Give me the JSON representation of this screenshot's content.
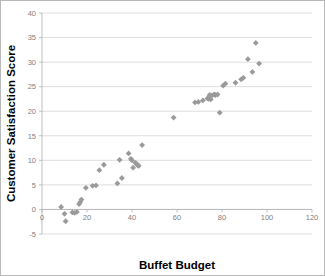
{
  "chart_data": {
    "type": "scatter",
    "title": "",
    "xlabel": "Buffet Budget",
    "ylabel": "Customer Satisfaction Score",
    "xlim": [
      0,
      120
    ],
    "ylim": [
      -5,
      40
    ],
    "xticks": [
      0,
      20,
      40,
      60,
      80,
      100,
      120
    ],
    "yticks": [
      -5,
      0,
      5,
      10,
      15,
      20,
      25,
      30,
      35,
      40
    ],
    "grid": "horizontal",
    "legend": "none",
    "marker": "diamond",
    "marker_color": "#9a9a9a",
    "series": [
      {
        "name": "Customer Satisfaction Score",
        "points": [
          [
            8.5,
            0.5
          ],
          [
            10.0,
            -0.9
          ],
          [
            10.5,
            -2.4
          ],
          [
            13.5,
            -0.6
          ],
          [
            14.5,
            -0.7
          ],
          [
            15.5,
            -0.5
          ],
          [
            16.5,
            1.1
          ],
          [
            17.0,
            1.5
          ],
          [
            17.5,
            2.0
          ],
          [
            19.5,
            4.4
          ],
          [
            22.5,
            4.8
          ],
          [
            24.0,
            4.9
          ],
          [
            25.5,
            8.0
          ],
          [
            27.5,
            9.1
          ],
          [
            33.5,
            5.3
          ],
          [
            34.5,
            10.1
          ],
          [
            35.5,
            6.4
          ],
          [
            38.5,
            11.4
          ],
          [
            39.5,
            10.3
          ],
          [
            40.0,
            10.0
          ],
          [
            40.5,
            8.5
          ],
          [
            41.5,
            9.5
          ],
          [
            42.0,
            9.3
          ],
          [
            42.5,
            9.0
          ],
          [
            43.0,
            8.9
          ],
          [
            44.5,
            13.1
          ],
          [
            58.5,
            18.7
          ],
          [
            68.0,
            21.8
          ],
          [
            69.5,
            21.9
          ],
          [
            71.5,
            22.2
          ],
          [
            73.5,
            22.6
          ],
          [
            74.0,
            22.5
          ],
          [
            74.5,
            23.3
          ],
          [
            75.0,
            22.4
          ],
          [
            75.5,
            23.2
          ],
          [
            76.5,
            23.4
          ],
          [
            77.0,
            23.3
          ],
          [
            78.0,
            23.4
          ],
          [
            79.0,
            19.7
          ],
          [
            80.5,
            25.2
          ],
          [
            81.5,
            25.6
          ],
          [
            86.0,
            25.8
          ],
          [
            88.5,
            26.5
          ],
          [
            89.5,
            26.8
          ],
          [
            91.5,
            30.6
          ],
          [
            93.5,
            28.0
          ],
          [
            95.0,
            33.9
          ],
          [
            96.5,
            29.7
          ]
        ]
      }
    ]
  }
}
